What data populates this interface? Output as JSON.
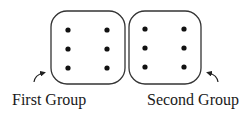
{
  "diagram": {
    "title": "",
    "groups": [
      {
        "id": "first",
        "label": "First Group",
        "box": {
          "x": 51,
          "y": 11,
          "w": 74,
          "h": 73,
          "r": 16
        },
        "dots": [
          {
            "cx": 68,
            "cy": 30
          },
          {
            "cx": 107,
            "cy": 30
          },
          {
            "cx": 68,
            "cy": 49
          },
          {
            "cx": 107,
            "cy": 49
          },
          {
            "cx": 68,
            "cy": 68
          },
          {
            "cx": 107,
            "cy": 68
          }
        ],
        "arrow": {
          "from": [
            34,
            82
          ],
          "to": [
            46,
            72
          ],
          "direction": "up-right"
        }
      },
      {
        "id": "second",
        "label": "Second Group",
        "box": {
          "x": 129,
          "y": 11,
          "w": 72,
          "h": 73,
          "r": 16
        },
        "dots": [
          {
            "cx": 145,
            "cy": 29
          },
          {
            "cx": 184,
            "cy": 29
          },
          {
            "cx": 145,
            "cy": 48
          },
          {
            "cx": 184,
            "cy": 48
          },
          {
            "cx": 145,
            "cy": 67
          },
          {
            "cx": 184,
            "cy": 67
          }
        ],
        "arrow": {
          "from": [
            218,
            82
          ],
          "to": [
            206,
            72
          ],
          "direction": "up-left"
        }
      }
    ],
    "dots_per_group": 6,
    "colors": {
      "stroke": "#333333",
      "dot": "#111111",
      "text": "#1a1a1a",
      "background": "#ffffff"
    }
  }
}
